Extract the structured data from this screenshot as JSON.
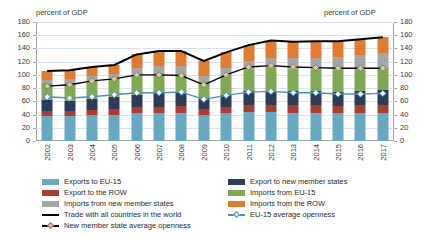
{
  "chart_data": {
    "type": "bar",
    "title": "",
    "subtitle": "",
    "ylabel_left": "percent of GDP",
    "ylabel_right": "percent of GDP",
    "xlabel": "",
    "ylim": [
      0,
      180
    ],
    "yticks": [
      0,
      20,
      40,
      60,
      80,
      100,
      120,
      140,
      160,
      180
    ],
    "grid": true,
    "legend_position": "bottom",
    "stacked": true,
    "categories": [
      "2002",
      "2003",
      "2004",
      "2005",
      "2006",
      "2007",
      "2008",
      "2009",
      "2010",
      "2011",
      "2012",
      "2013",
      "2014",
      "2015",
      "2016",
      "2017"
    ],
    "series": [
      {
        "name": "Exports to EU-15",
        "color": "#67a9c3",
        "type": "bar-segment",
        "values": [
          38,
          38,
          39,
          40,
          42,
          43,
          43,
          40,
          42,
          44,
          44,
          43,
          43,
          42,
          42,
          42
        ]
      },
      {
        "name": "Export to the ROW",
        "color": "#a83e32",
        "type": "bar-segment",
        "values": [
          8,
          8,
          8,
          8,
          9,
          9,
          10,
          8,
          9,
          10,
          11,
          11,
          11,
          11,
          12,
          13
        ]
      },
      {
        "name": "Export to new member states",
        "color": "#2e3b56",
        "type": "bar-segment",
        "values": [
          16,
          15,
          16,
          18,
          19,
          20,
          20,
          16,
          19,
          21,
          21,
          21,
          21,
          21,
          21,
          22
        ]
      },
      {
        "name": "Imports from EU-15",
        "color": "#7fa952",
        "type": "bar-segment",
        "values": [
          26,
          27,
          28,
          28,
          30,
          31,
          29,
          25,
          29,
          32,
          34,
          33,
          33,
          33,
          33,
          33
        ]
      },
      {
        "name": "Imports from new member states",
        "color": "#a6a6a6",
        "type": "bar-segment",
        "values": [
          5,
          6,
          7,
          8,
          10,
          11,
          12,
          10,
          12,
          14,
          16,
          17,
          18,
          20,
          22,
          23
        ]
      },
      {
        "name": "Imports from the ROW",
        "color": "#e07b2f",
        "type": "bar-segment",
        "values": [
          13,
          13,
          14,
          13,
          21,
          22,
          22,
          22,
          23,
          24,
          26,
          25,
          25,
          24,
          24,
          24
        ]
      }
    ],
    "lines": [
      {
        "name": "Trade with all countries in the world",
        "color": "#000000",
        "marker": "none",
        "values": [
          106,
          107,
          112,
          115,
          131,
          136,
          136,
          121,
          134,
          145,
          152,
          150,
          151,
          151,
          154,
          157
        ]
      },
      {
        "name": "New member state average openness",
        "color": "#000000",
        "marker": "diamond",
        "marker_fill": "#d6c9a8",
        "marker_edge": "#8c7a5c",
        "values": [
          83,
          85,
          91,
          94,
          100,
          100,
          99,
          85,
          100,
          112,
          114,
          112,
          111,
          110,
          110,
          110
        ]
      },
      {
        "name": "EU-15 average openness",
        "color": "#4a90c4",
        "marker": "diamond",
        "marker_fill": "#ffffff",
        "marker_edge": "#4a90c4",
        "values": [
          67,
          65,
          67,
          70,
          73,
          73,
          74,
          63,
          69,
          74,
          75,
          73,
          73,
          71,
          71,
          72
        ]
      }
    ]
  },
  "notes": {
    "left_axis_caption": "percent of GDP",
    "right_axis_caption": "percent of GDP"
  },
  "legend": {
    "column1": [
      {
        "label": "Exports to EU-15",
        "swatch": "#67a9c3",
        "kind": "box"
      },
      {
        "label": "Export to the ROW",
        "swatch": "#a83e32",
        "kind": "box"
      },
      {
        "label": "Imports from new member states",
        "swatch": "#a6a6a6",
        "kind": "box"
      },
      {
        "label": "Trade with all countries in the world",
        "swatch": "#000000",
        "kind": "line"
      },
      {
        "label": "New member state average openness",
        "swatch": "#000000",
        "kind": "line-marker"
      }
    ],
    "column2": [
      {
        "label": "Export to new member states",
        "swatch": "#2e3b56",
        "kind": "box"
      },
      {
        "label": "Imports from EU-15",
        "swatch": "#7fa952",
        "kind": "box"
      },
      {
        "label": "Imports from the ROW",
        "swatch": "#e07b2f",
        "kind": "box"
      },
      {
        "label": "EU-15 average openness",
        "swatch": "#4a90c4",
        "kind": "line-marker"
      }
    ]
  }
}
